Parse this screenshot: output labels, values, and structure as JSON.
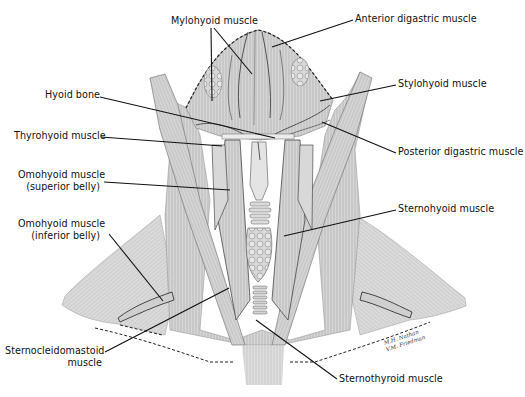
{
  "figure": {
    "type": "anatomical-illustration",
    "colors": {
      "background": "#ffffff",
      "muscle_fill": "#d2d2d2",
      "muscle_light": "#e6e6e6",
      "muscle_dark": "#9a9a9a",
      "outline": "#2a2a2a",
      "label_text": "#111111",
      "leader_line": "#111111"
    },
    "signature": {
      "line1": "M.H. Nathan",
      "line2": "V.M. Friedman"
    }
  },
  "labels": [
    {
      "id": "mylohyoid",
      "lines": [
        "Mylohyoid muscle"
      ],
      "x": 171,
      "y": 15,
      "align": "left",
      "leaders": [
        [
          211,
          28,
          212,
          101
        ],
        [
          214,
          28,
          252,
          74
        ]
      ]
    },
    {
      "id": "anterior-digastric",
      "lines": [
        "Anterior digastric muscle"
      ],
      "x": 355,
      "y": 13,
      "align": "left",
      "leaders": [
        [
          353,
          20,
          272,
          47
        ]
      ]
    },
    {
      "id": "stylohyoid",
      "lines": [
        "Stylohyoid muscle"
      ],
      "x": 398,
      "y": 78,
      "align": "left",
      "leaders": [
        [
          396,
          85,
          320,
          101
        ]
      ]
    },
    {
      "id": "hyoid-bone",
      "lines": [
        "Hyoid bone"
      ],
      "x": 45,
      "y": 89,
      "align": "left",
      "leaders": [
        [
          100,
          97,
          275,
          138
        ]
      ]
    },
    {
      "id": "thyrohyoid",
      "lines": [
        "Thyrohyoid muscle"
      ],
      "x": 14,
      "y": 130,
      "align": "left",
      "leaders": [
        [
          101,
          137,
          222,
          146
        ]
      ]
    },
    {
      "id": "posterior-digastric",
      "lines": [
        "Posterior digastric muscle"
      ],
      "x": 398,
      "y": 146,
      "align": "left",
      "leaders": [
        [
          396,
          153,
          322,
          122
        ]
      ]
    },
    {
      "id": "omohyoid-superior",
      "lines": [
        "Omohyoid muscle",
        "(superior belly)"
      ],
      "x": 18,
      "y": 169,
      "align": "right",
      "w": 82,
      "leaders": [
        [
          104,
          182,
          230,
          190
        ]
      ]
    },
    {
      "id": "sternohyoid",
      "lines": [
        "Sternohyoid muscle"
      ],
      "x": 398,
      "y": 203,
      "align": "left",
      "leaders": [
        [
          396,
          210,
          284,
          236
        ]
      ]
    },
    {
      "id": "omohyoid-inferior",
      "lines": [
        "Omohyoid muscle",
        "(inferior belly)"
      ],
      "x": 18,
      "y": 218,
      "align": "right",
      "w": 82,
      "leaders": [
        [
          109,
          234,
          163,
          301
        ]
      ]
    },
    {
      "id": "sternocleidomastoid",
      "lines": [
        "Sternocleidomastoid",
        "muscle"
      ],
      "x": 5,
      "y": 345,
      "align": "right",
      "w": 97,
      "leaders": [
        [
          105,
          352,
          229,
          288
        ]
      ]
    },
    {
      "id": "sternothyroid",
      "lines": [
        "Sternothyroid muscle"
      ],
      "x": 339,
      "y": 373,
      "align": "left",
      "leaders": [
        [
          337,
          379,
          256,
          320
        ]
      ]
    }
  ]
}
